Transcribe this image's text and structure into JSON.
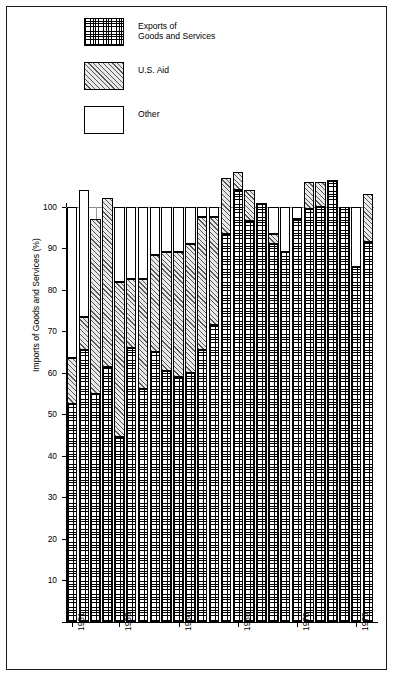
{
  "figure": {
    "border_color": "#1a1a1a",
    "background": "#ffffff"
  },
  "legend": {
    "items": [
      {
        "key": "exports",
        "label": "Exports of\nGoods and Services",
        "pattern": "cross-hatch-check",
        "color": "#ffffff"
      },
      {
        "key": "aid",
        "label": "U.S. Aid",
        "pattern": "diagonal-hatch",
        "color": "#e9e9e9"
      },
      {
        "key": "other",
        "label": "Other",
        "pattern": "solid-white",
        "color": "#ffffff"
      }
    ]
  },
  "chart_data": {
    "type": "bar",
    "stacked": true,
    "title": "",
    "xlabel": "",
    "ylabel": "Imports of Goods and Services (%)",
    "ylim": [
      0,
      108
    ],
    "yticks": [
      10,
      20,
      30,
      40,
      50,
      60,
      70,
      80,
      90,
      100
    ],
    "ytick_labels": [
      "10",
      "20",
      "30",
      "40",
      "50",
      "60",
      "70",
      "80",
      "90",
      "100"
    ],
    "grid": "horizontal-at-100-plus-vertical-between-bars",
    "legend_position": "top-left",
    "categories": [
      "1951",
      "1952",
      "1953",
      "1954",
      "1955",
      "1956",
      "1957",
      "1958",
      "1959",
      "1960",
      "1961",
      "1962",
      "1963",
      "1964",
      "1965",
      "1966",
      "1967",
      "1968",
      "1969",
      "1970",
      "1971",
      "1972",
      "1973",
      "1974",
      "1975",
      "1976"
    ],
    "xtick_labels": [
      "1951",
      "1955",
      "1960",
      "1965",
      "1970",
      "1975"
    ],
    "xtick_categories": [
      "1951",
      "1955",
      "1960",
      "1965",
      "1970",
      "1975"
    ],
    "series": [
      {
        "name": "Exports of Goods and Services",
        "key": "exports",
        "values": [
          52.5,
          65.5,
          55.0,
          61.5,
          44.5,
          66.0,
          56.0,
          65.0,
          60.5,
          59.0,
          60.0,
          65.5,
          71.5,
          93.5,
          104.0,
          96.5,
          101.0,
          91.0,
          89.0,
          97.0,
          99.5,
          100.0,
          106.5,
          100.0,
          85.5,
          91.5
        ]
      },
      {
        "name": "U.S. Aid",
        "key": "aid",
        "values": [
          11.0,
          8.0,
          42.0,
          40.5,
          37.5,
          16.5,
          26.5,
          23.5,
          28.5,
          30.0,
          31.0,
          32.0,
          26.0,
          13.5,
          4.5,
          7.5,
          0.0,
          2.5,
          0.0,
          0.0,
          6.5,
          6.0,
          0.0,
          0.0,
          0.0,
          11.5
        ]
      },
      {
        "name": "Other",
        "key": "other",
        "values": [
          36.5,
          30.5,
          0.0,
          0.0,
          18.0,
          17.5,
          17.5,
          11.5,
          11.0,
          11.0,
          9.0,
          2.5,
          2.5,
          0.0,
          0.0,
          0.0,
          0.0,
          6.5,
          11.0,
          3.0,
          0.0,
          0.0,
          0.0,
          0.0,
          14.5,
          0.0
        ]
      }
    ],
    "bar_totals": [
      100.0,
      104.0,
      97.0,
      102.0,
      100.0,
      100.0,
      100.0,
      100.0,
      100.0,
      100.0,
      100.0,
      100.0,
      100.0,
      107.0,
      108.5,
      104.0,
      101.0,
      100.0,
      100.0,
      100.0,
      106.0,
      106.0,
      106.5,
      100.0,
      100.0,
      103.0
    ]
  }
}
